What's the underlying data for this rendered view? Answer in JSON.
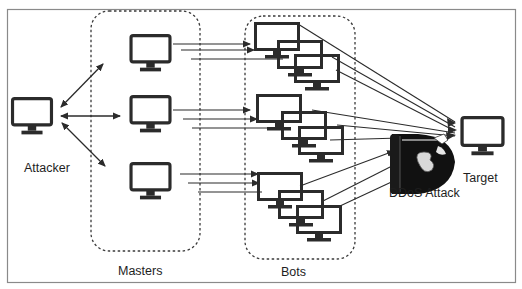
{
  "diagram": {
    "colors": {
      "stroke": "#2b2b2b",
      "frame": "#8a8a8a",
      "dashed": "#3a3a3a",
      "background": "#ffffff",
      "bullet_body": "#111111"
    },
    "nodes": {
      "attacker": {
        "label": "Attacker",
        "icon": "monitor-icon"
      },
      "masters": {
        "label": "Masters",
        "count": 3,
        "icon": "monitor-icon"
      },
      "bots": {
        "label": "Bots",
        "clusters": 3,
        "per_cluster": 3,
        "icon": "monitor-icon"
      },
      "attack": {
        "label": "DDoS Attack",
        "icon": "bullet-bill-icon"
      },
      "target": {
        "label": "Target",
        "icon": "monitor-icon"
      }
    },
    "edges": [
      {
        "from": "Attacker",
        "to": "Master 1",
        "type": "bidirectional"
      },
      {
        "from": "Attacker",
        "to": "Master 2",
        "type": "bidirectional"
      },
      {
        "from": "Attacker",
        "to": "Master 3",
        "type": "bidirectional"
      },
      {
        "from": "Master 1",
        "to": "Bots cluster 1",
        "type": "arrows",
        "count": 3
      },
      {
        "from": "Master 2",
        "to": "Bots cluster 2",
        "type": "arrows",
        "count": 3
      },
      {
        "from": "Master 3",
        "to": "Bots cluster 3",
        "type": "arrows",
        "count": 3
      },
      {
        "from": "Bots",
        "to": "Target",
        "type": "converging-lines",
        "count": 9
      }
    ]
  }
}
